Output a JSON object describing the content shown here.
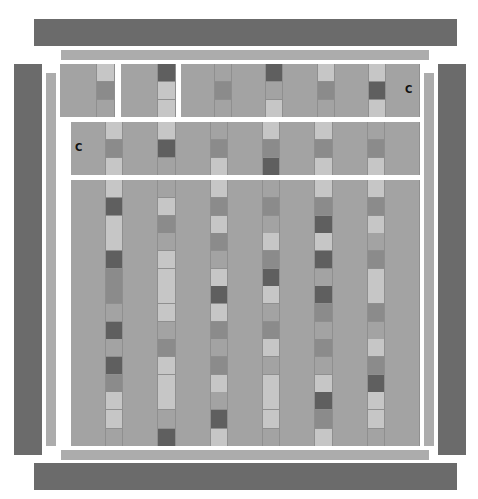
{
  "colors": {
    "border_dark": "#6b6b6b",
    "border_light": "#acacac",
    "base": "#a3a3a3",
    "tones": {
      "B": "#a3a3a3",
      "L": "#c6c6c6",
      "M": "#8b8b8b",
      "D": "#5f5f5f"
    }
  },
  "labels": {
    "top_row_label": "C",
    "second_row_label": "C"
  },
  "top_row_panels": [
    {
      "segments": [
        "W",
        "LMB"
      ]
    },
    {
      "segments": [
        "W",
        "DLL"
      ]
    },
    {
      "segments": [
        "W",
        "BMB",
        "W",
        "DBL",
        "W",
        "LMB",
        "W",
        "LDL",
        "W"
      ]
    }
  ],
  "second_row": {
    "segments": [
      "W",
      "LML",
      "W",
      "LDB",
      "W",
      "BML",
      "W",
      "LMD",
      "W",
      "LML",
      "W",
      "BML",
      "W"
    ]
  },
  "main_grid_rows": [
    {
      "segments": [
        "W",
        "LDL",
        "W",
        "BLM",
        "W",
        "LML",
        "W",
        "BMB",
        "W",
        "LMD",
        "W",
        "LML",
        "W"
      ]
    },
    {
      "segments": [
        "W",
        "LDM",
        "W",
        "BLL",
        "W",
        "MBL",
        "W",
        "LMD",
        "W",
        "LDB",
        "W",
        "BML",
        "W"
      ]
    },
    {
      "segments": [
        "W",
        "MBD",
        "W",
        "LLB",
        "W",
        "DLM",
        "W",
        "LBM",
        "W",
        "DMB",
        "W",
        "LMB",
        "W"
      ]
    },
    {
      "segments": [
        "W",
        "BDM",
        "W",
        "MLL",
        "W",
        "BML",
        "W",
        "LBL",
        "W",
        "MBL",
        "W",
        "LMD",
        "W"
      ]
    },
    {
      "segments": [
        "W",
        "LLB",
        "W",
        "LBD",
        "W",
        "BDL",
        "W",
        "LLB",
        "W",
        "DML",
        "W",
        "LLB",
        "W"
      ]
    }
  ]
}
